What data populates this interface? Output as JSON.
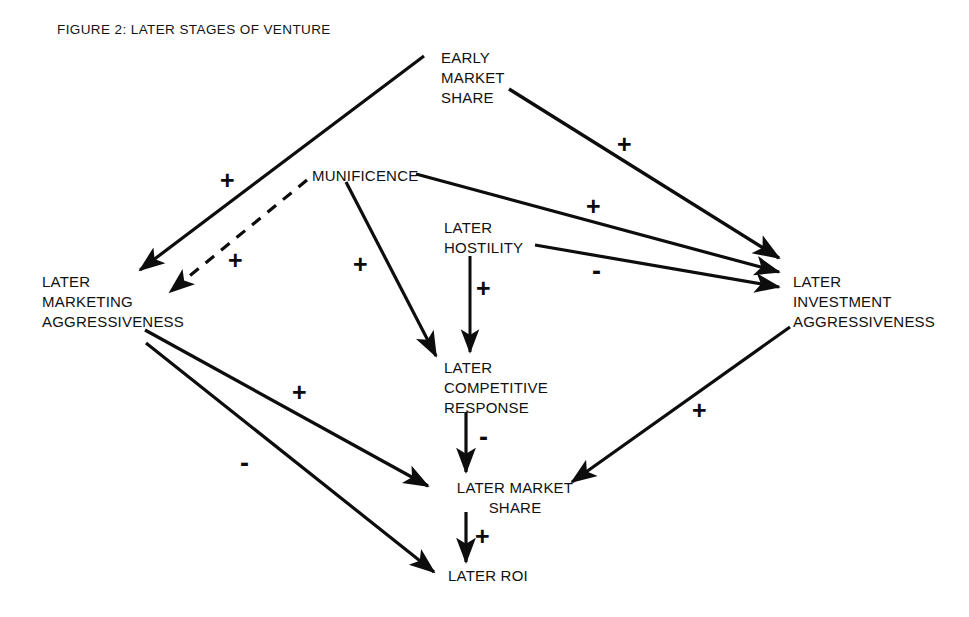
{
  "figure": {
    "title": "FIGURE 2: LATER STAGES OF VENTURE",
    "background_color": "#ffffff",
    "ink_color": "#111111",
    "width": 969,
    "height": 617
  },
  "nodes": [
    {
      "id": "early-market-share",
      "label": "EARLY\nMARKET\nSHARE",
      "x": 441,
      "y": 48,
      "align": "left"
    },
    {
      "id": "munificence",
      "label": "MUNIFICENCE",
      "x": 312,
      "y": 166,
      "align": "left"
    },
    {
      "id": "later-hostility",
      "label": "LATER\nHOSTILITY",
      "x": 444,
      "y": 218,
      "align": "left"
    },
    {
      "id": "later-marketing-aggressiveness",
      "label": "LATER\nMARKETING\nAGGRESSIVENESS",
      "x": 42,
      "y": 272,
      "align": "left"
    },
    {
      "id": "later-investment-aggressiveness",
      "label": "LATER\nINVESTMENT\nAGGRESSIVENESS",
      "x": 793,
      "y": 272,
      "align": "left"
    },
    {
      "id": "later-competitive-response",
      "label": "LATER\nCOMPETITIVE\nRESPONSE",
      "x": 444,
      "y": 358,
      "align": "left"
    },
    {
      "id": "later-market-share",
      "label": "LATER MARKET\nSHARE",
      "x": 440,
      "y": 478,
      "align": "left"
    },
    {
      "id": "later-roi",
      "label": "LATER ROI",
      "x": 448,
      "y": 566,
      "align": "left"
    }
  ],
  "edges": [
    {
      "id": "ems-to-lma",
      "from": "early-market-share",
      "to": "later-marketing-aggressiveness",
      "sign": "+",
      "style": "solid",
      "sign_x": 220,
      "sign_y": 168
    },
    {
      "id": "ems-to-lia",
      "from": "early-market-share",
      "to": "later-investment-aggressiveness",
      "sign": "+",
      "style": "solid",
      "sign_x": 617,
      "sign_y": 132
    },
    {
      "id": "mun-to-lma",
      "from": "munificence",
      "to": "later-marketing-aggressiveness",
      "sign": "+",
      "style": "dashed",
      "sign_x": 228,
      "sign_y": 248
    },
    {
      "id": "mun-to-lia",
      "from": "munificence",
      "to": "later-investment-aggressiveness",
      "sign": "+",
      "style": "solid",
      "sign_x": 586,
      "sign_y": 194
    },
    {
      "id": "mun-to-lcr",
      "from": "munificence",
      "to": "later-competitive-response",
      "sign": "+",
      "style": "solid",
      "sign_x": 353,
      "sign_y": 252
    },
    {
      "id": "hostility-to-lia",
      "from": "later-hostility",
      "to": "later-investment-aggressiveness",
      "sign": "-",
      "style": "solid",
      "sign_x": 592,
      "sign_y": 258
    },
    {
      "id": "hostility-to-lcr",
      "from": "later-hostility",
      "to": "later-competitive-response",
      "sign": "+",
      "style": "solid",
      "sign_x": 476,
      "sign_y": 276
    },
    {
      "id": "lcr-to-lms",
      "from": "later-competitive-response",
      "to": "later-market-share",
      "sign": "-",
      "style": "solid",
      "sign_x": 479,
      "sign_y": 424
    },
    {
      "id": "lma-to-lms",
      "from": "later-marketing-aggressiveness",
      "to": "later-market-share",
      "sign": "+",
      "style": "solid",
      "sign_x": 292,
      "sign_y": 380
    },
    {
      "id": "lma-to-roi",
      "from": "later-marketing-aggressiveness",
      "to": "later-roi",
      "sign": "-",
      "style": "solid",
      "sign_x": 240,
      "sign_y": 450
    },
    {
      "id": "lia-to-lms",
      "from": "later-investment-aggressiveness",
      "to": "later-market-share",
      "sign": "+",
      "style": "solid",
      "sign_x": 692,
      "sign_y": 398
    },
    {
      "id": "lms-to-roi",
      "from": "later-market-share",
      "to": "later-roi",
      "sign": "+",
      "style": "solid",
      "sign_x": 475,
      "sign_y": 524
    }
  ]
}
